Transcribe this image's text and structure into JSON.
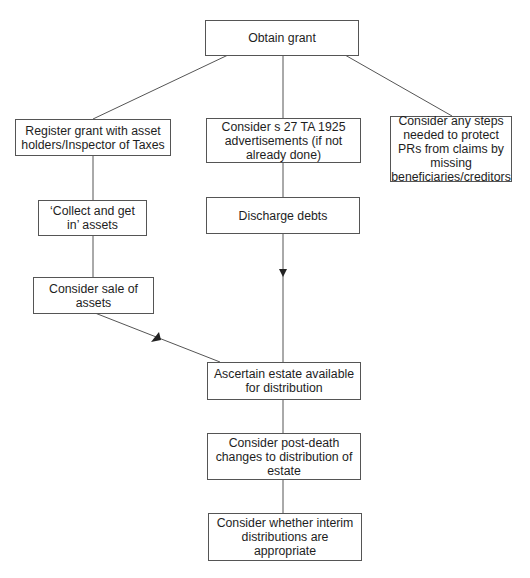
{
  "nodes": {
    "obtain_grant": "Obtain grant",
    "register_grant": "Register grant with asset holders/Inspector of Taxes",
    "consider_s27": "Consider s 27 TA 1925 advertisements (if not already done)",
    "protect_prs": "Consider any steps needed to protect PRs from claims by missing beneficiaries/creditors",
    "collect_assets": "‘Collect and get in’ assets",
    "discharge_debts": "Discharge debts",
    "sale_of_assets": "Consider sale of assets",
    "ascertain_estate": "Ascertain estate available for distribution",
    "post_death_changes": "Consider post-death changes to distribution of estate",
    "interim_distributions": "Consider whether interim distributions are appropriate"
  },
  "edges": [
    {
      "from": "obtain_grant",
      "to": "register_grant"
    },
    {
      "from": "obtain_grant",
      "to": "consider_s27"
    },
    {
      "from": "obtain_grant",
      "to": "protect_prs"
    },
    {
      "from": "register_grant",
      "to": "collect_assets"
    },
    {
      "from": "collect_assets",
      "to": "sale_of_assets"
    },
    {
      "from": "consider_s27",
      "to": "discharge_debts"
    },
    {
      "from": "discharge_debts",
      "to": "ascertain_estate",
      "arrow": true
    },
    {
      "from": "sale_of_assets",
      "to": "ascertain_estate",
      "arrow": true
    },
    {
      "from": "ascertain_estate",
      "to": "post_death_changes"
    },
    {
      "from": "post_death_changes",
      "to": "interim_distributions"
    }
  ],
  "colors": {
    "line": "#555555",
    "border": "#555555",
    "text": "#1e1e1e"
  }
}
